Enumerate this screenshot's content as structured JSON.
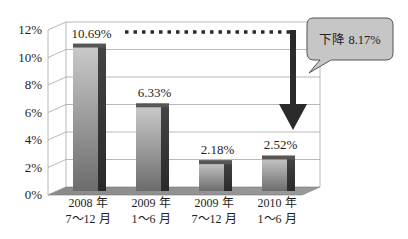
{
  "chart_data": {
    "type": "bar",
    "title": "",
    "xlabel": "",
    "ylabel": "",
    "categories": [
      "2008 年 7～12 月",
      "2009 年 1～6 月",
      "2009 年 7～12 月",
      "2010 年 1～6 月"
    ],
    "values": [
      10.69,
      6.33,
      2.18,
      2.52
    ],
    "value_labels": [
      "10.69%",
      "6.33%",
      "2.18%",
      "2.52%"
    ],
    "ylim": [
      0,
      12
    ],
    "yticks": [
      "0%",
      "2%",
      "4%",
      "6%",
      "8%",
      "10%",
      "12%"
    ],
    "grid": true,
    "style": "3d-column",
    "annotations": [
      {
        "type": "dotted-line-arrow",
        "from_category": "2008 年 7～12 月",
        "to_category": "2010 年 1～6 月"
      },
      {
        "type": "callout",
        "text": "下降 8.17%"
      }
    ]
  },
  "category_labels": [
    {
      "line1": "2008 年",
      "line2": "7～12 月"
    },
    {
      "line1": "2009 年",
      "line2": "1～6 月"
    },
    {
      "line1": "2009 年",
      "line2": "7～12 月"
    },
    {
      "line1": "2010 年",
      "line2": "1～6 月"
    }
  ],
  "callout": {
    "text": "下降 8.17%"
  },
  "colors": {
    "bar_top_light": "#c9c9c9",
    "bar_bottom_dark": "#6e6e6e",
    "bar_side": "#363636",
    "floor": "#8e8e8e",
    "callout_fill": "#c6c6c6",
    "arrow": "#2b2b2b"
  }
}
